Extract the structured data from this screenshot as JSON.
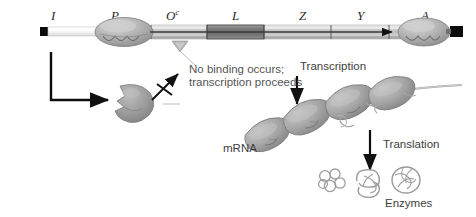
{
  "figure": {
    "type": "biology-diagram"
  },
  "gene_map": {
    "label": "DNA / operon map",
    "segments": [
      {
        "name": "I",
        "label": "I",
        "sup": "",
        "x": 55,
        "kind": "regulator-gene"
      },
      {
        "name": "P",
        "label": "P",
        "sup": "",
        "x": 115,
        "kind": "promoter"
      },
      {
        "name": "Oc",
        "label": "O",
        "sup": "c",
        "x": 172,
        "kind": "operator-mutant"
      },
      {
        "name": "L",
        "label": "L",
        "sup": "",
        "x": 236,
        "kind": "structural-gene"
      },
      {
        "name": "Z",
        "label": "Z",
        "sup": "",
        "x": 303,
        "kind": "structural-gene"
      },
      {
        "name": "Y",
        "label": "Y",
        "sup": "",
        "x": 360,
        "kind": "structural-gene"
      },
      {
        "name": "A",
        "label": "A",
        "sup": "",
        "x": 425,
        "kind": "structural-gene"
      }
    ]
  },
  "annotations": {
    "no_binding_line1": "No binding occurs;",
    "no_binding_line2": "transcription proceeds",
    "transcription": "Transcription",
    "translation": "Translation",
    "mrna": "mRNA",
    "enzymes": "Enzymes"
  },
  "elements": {
    "repressor": "repressor-protein",
    "operator_marker": "operator-site-triangle",
    "transcription_arrow": "rightward-transcription-arrow",
    "blocked_binding_arrow": "crossed-out-binding-arrow",
    "ribosomes_count": 4,
    "enzyme_blobs_count": 3
  },
  "colors": {
    "dna_light": "#dcdcdc",
    "dna_mid": "#b9b9b9",
    "dna_dark": "#6f6f6f",
    "protein_gray": "#9a9a9a",
    "ink": "#111111",
    "text": "#3d3d3d"
  }
}
